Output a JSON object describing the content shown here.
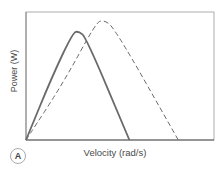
{
  "panel_label": "A",
  "chart_data": {
    "type": "line",
    "title": "",
    "xlabel": "Velocity (rad/s)",
    "ylabel": "Power (W)",
    "xlim": [
      0,
      1
    ],
    "ylim": [
      0,
      1
    ],
    "grid": false,
    "legend": null,
    "series": [
      {
        "name": "solid curve",
        "style": "solid",
        "color": "#666666",
        "points": [
          [
            0,
            0
          ],
          [
            0.14,
            0.5
          ],
          [
            0.25,
            0.84
          ],
          [
            0.28,
            0.85
          ],
          [
            0.32,
            0.8
          ],
          [
            0.55,
            0
          ]
        ]
      },
      {
        "name": "dashed curve",
        "style": "dashed",
        "color": "#666666",
        "points": [
          [
            0,
            0
          ],
          [
            0.2,
            0.45
          ],
          [
            0.37,
            0.91
          ],
          [
            0.41,
            0.94
          ],
          [
            0.47,
            0.88
          ],
          [
            0.81,
            0
          ]
        ]
      }
    ]
  }
}
